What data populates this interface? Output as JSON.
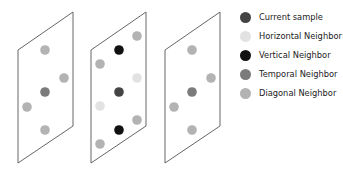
{
  "colors": {
    "current": "#444444",
    "horizontal": "#e2e2e2",
    "vertical": "#111111",
    "temporal": "#7b7b7b",
    "diagonal": "#b3b3b3",
    "frame_stroke": "#555555"
  },
  "legend": {
    "items": [
      {
        "key": "current",
        "label": "Current sample"
      },
      {
        "key": "horizontal",
        "label": "Horizontal Neighbor"
      },
      {
        "key": "vertical",
        "label": "Vertical Neighbor"
      },
      {
        "key": "temporal",
        "label": "Temporal Neighbor"
      },
      {
        "key": "diagonal",
        "label": "Diagonal Neighbor"
      }
    ]
  },
  "frames": [
    {
      "name": "previous-frame",
      "points": "18,50 73,12 73,126 18,163",
      "dots": [
        {
          "x": 45,
          "y": 50,
          "type": "diagonal"
        },
        {
          "x": 64,
          "y": 78,
          "type": "diagonal"
        },
        {
          "x": 45,
          "y": 92,
          "type": "temporal"
        },
        {
          "x": 27,
          "y": 107,
          "type": "diagonal"
        },
        {
          "x": 45,
          "y": 130,
          "type": "diagonal"
        }
      ]
    },
    {
      "name": "current-frame",
      "points": "91,50 146,12 146,126 91,163",
      "dots": [
        {
          "x": 137,
          "y": 36,
          "type": "diagonal"
        },
        {
          "x": 119,
          "y": 50,
          "type": "vertical"
        },
        {
          "x": 100,
          "y": 64,
          "type": "diagonal"
        },
        {
          "x": 137,
          "y": 78,
          "type": "horizontal"
        },
        {
          "x": 119,
          "y": 92,
          "type": "current"
        },
        {
          "x": 100,
          "y": 106,
          "type": "horizontal"
        },
        {
          "x": 137,
          "y": 120,
          "type": "diagonal"
        },
        {
          "x": 119,
          "y": 130,
          "type": "vertical"
        },
        {
          "x": 100,
          "y": 144,
          "type": "diagonal"
        }
      ]
    },
    {
      "name": "next-frame",
      "points": "165,50 220,12 220,126 165,163",
      "dots": [
        {
          "x": 192,
          "y": 50,
          "type": "diagonal"
        },
        {
          "x": 211,
          "y": 78,
          "type": "diagonal"
        },
        {
          "x": 192,
          "y": 92,
          "type": "temporal"
        },
        {
          "x": 174,
          "y": 107,
          "type": "diagonal"
        },
        {
          "x": 192,
          "y": 130,
          "type": "diagonal"
        }
      ]
    }
  ]
}
